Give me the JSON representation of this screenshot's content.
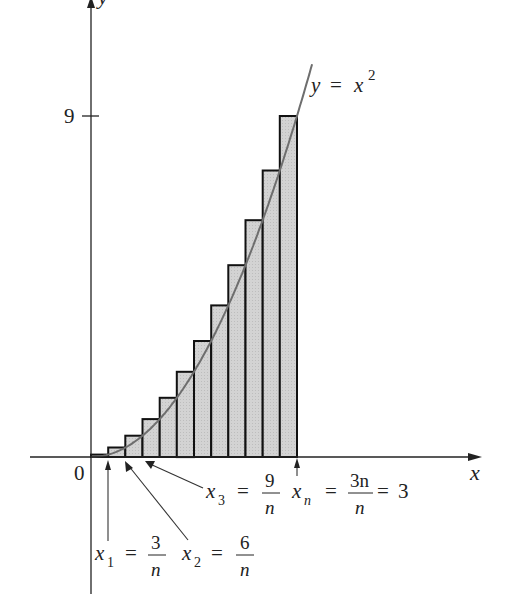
{
  "chart_data": {
    "type": "bar",
    "title": "",
    "xlabel": "x",
    "ylabel": "y",
    "curve_label": "y = x²",
    "curve": "y = x^2",
    "n_rectangles": 12,
    "x_range": [
      0,
      3
    ],
    "ylim": [
      0,
      9
    ],
    "y_ticks": [
      {
        "value": 9,
        "label": "9"
      }
    ],
    "x_origin_label": "0",
    "categories": [
      "0.25",
      "0.5",
      "0.75",
      "1.0",
      "1.25",
      "1.5",
      "1.75",
      "2.0",
      "2.25",
      "2.5",
      "2.75",
      "3.0"
    ],
    "values": [
      0.0625,
      0.25,
      0.5625,
      1.0,
      1.5625,
      2.25,
      3.0625,
      4.0,
      5.0625,
      6.25,
      7.5625,
      9.0
    ],
    "annotations": [
      {
        "id": "x1",
        "text": "x₁ = 3/n",
        "points_to": 0.25
      },
      {
        "id": "x2",
        "text": "x₂ = 6/n",
        "points_to": 0.5
      },
      {
        "id": "x3",
        "text": "x₃ = 9/n",
        "points_to": 0.75
      },
      {
        "id": "xn",
        "text": "xₙ = 3n/n = 3",
        "points_to": 3.0
      }
    ],
    "grid": false,
    "legend": "none",
    "colors": {
      "bar_fill": "#d0d0d0",
      "bar_stroke": "#111111",
      "curve": "#6e6e6e",
      "axis": "#222222"
    }
  },
  "labels": {
    "y_axis": "y",
    "x_axis": "x",
    "origin": "0",
    "tick_9": "9",
    "curve": {
      "y": "y",
      "eq": "=",
      "x": "x",
      "exp": "2"
    },
    "x1": {
      "var": "x",
      "sub": "1",
      "eq": "=",
      "num": "3",
      "den": "n"
    },
    "x2": {
      "var": "x",
      "sub": "2",
      "eq": "=",
      "num": "6",
      "den": "n"
    },
    "x3": {
      "var": "x",
      "sub": "3",
      "eq": "=",
      "num": "9",
      "den": "n"
    },
    "xn": {
      "var": "x",
      "sub": "n",
      "eq": "=",
      "num": "3n",
      "den": "n",
      "eq2": "=",
      "result": "3"
    }
  }
}
